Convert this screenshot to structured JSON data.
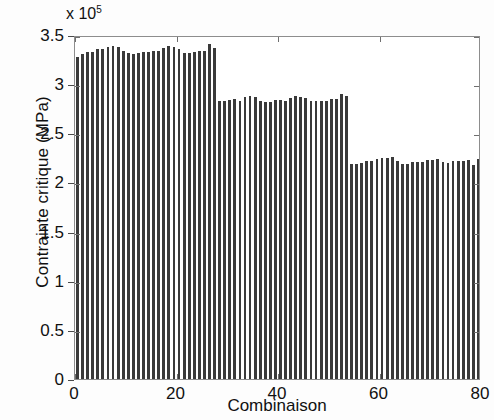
{
  "chart_data": {
    "type": "bar",
    "title": "",
    "xlabel": "Combinaison",
    "ylabel": "Contrainte critique (MPa)",
    "y_multiplier": "x 10",
    "y_multiplier_exponent": "5",
    "y_multiplier_value": 100000,
    "xlim": [
      0,
      80
    ],
    "ylim": [
      0,
      350000
    ],
    "xticks": [
      0,
      20,
      40,
      60,
      80
    ],
    "xtick_labels": [
      "0",
      "20",
      "40",
      "60",
      "80"
    ],
    "yticks": [
      0,
      50000,
      100000,
      150000,
      200000,
      250000,
      300000,
      350000
    ],
    "ytick_labels": [
      "0",
      "0.5",
      "1",
      "1.5",
      "2",
      "2.5",
      "3",
      "3.5"
    ],
    "grid": false,
    "bar_color": "#3a3a3a",
    "axis_color": "#8d8d8d",
    "legend": null,
    "categories": [
      1,
      2,
      3,
      4,
      5,
      6,
      7,
      8,
      9,
      10,
      11,
      12,
      13,
      14,
      15,
      16,
      17,
      18,
      19,
      20,
      21,
      22,
      23,
      24,
      25,
      26,
      27,
      28,
      29,
      30,
      31,
      32,
      33,
      34,
      35,
      36,
      37,
      38,
      39,
      40,
      41,
      42,
      43,
      44,
      45,
      46,
      47,
      48,
      49,
      50,
      51,
      52,
      53,
      54,
      55,
      56,
      57,
      58,
      59,
      60,
      61,
      62,
      63,
      64,
      65,
      66,
      67,
      68,
      69,
      70,
      71,
      72,
      73,
      74,
      75,
      76,
      77,
      78,
      79,
      80
    ],
    "values": [
      328000,
      331000,
      333000,
      333000,
      336000,
      336000,
      338000,
      339000,
      338000,
      334000,
      332000,
      331000,
      332000,
      333000,
      333000,
      334000,
      334000,
      337000,
      339000,
      338000,
      336000,
      332000,
      332000,
      333000,
      334000,
      334000,
      341000,
      337000,
      283000,
      283000,
      284000,
      285000,
      283000,
      287000,
      288000,
      287000,
      283000,
      282000,
      282000,
      284000,
      284000,
      283000,
      286000,
      288000,
      287000,
      286000,
      283000,
      283000,
      283000,
      283000,
      285000,
      285000,
      290000,
      288000,
      219000,
      219000,
      220000,
      222000,
      222000,
      224000,
      225000,
      225000,
      226000,
      222000,
      219000,
      219000,
      221000,
      221000,
      221000,
      223000,
      223000,
      224000,
      221000,
      220000,
      222000,
      222000,
      222000,
      223000,
      218000,
      224000
    ]
  }
}
